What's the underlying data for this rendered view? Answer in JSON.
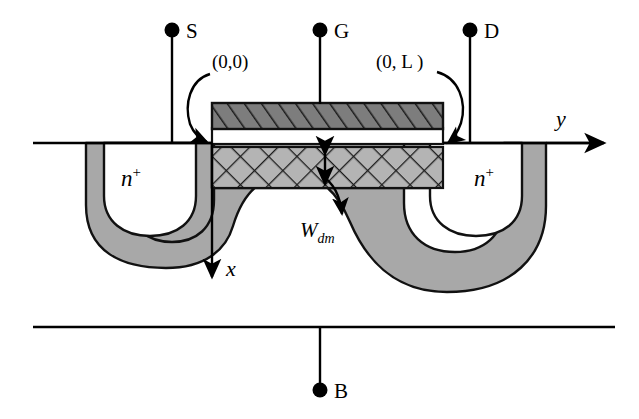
{
  "figure": {
    "background_color": "#ffffff",
    "line_color": "#000000",
    "depletion_fill": "#a8a8a8",
    "gate_fill": "#7a7a7a",
    "channel_fill": "#b0b0b0",
    "neutral_fill": "#ffffff"
  },
  "terminals": [
    {
      "id": "source",
      "label": "S",
      "dot_x": 172,
      "dot_y": 30
    },
    {
      "id": "gate",
      "label": "G",
      "dot_x": 320,
      "dot_y": 30
    },
    {
      "id": "drain",
      "label": "D",
      "dot_x": 470,
      "dot_y": 30
    },
    {
      "id": "body",
      "label": "B",
      "dot_x": 320,
      "dot_y": 390
    }
  ],
  "coordinate_callouts": [
    {
      "id": "origin",
      "label": "(0,0)",
      "text_x": 212,
      "text_y": 68
    },
    {
      "id": "channel-end",
      "label": "(0, L )",
      "label_plain": "(0, L)",
      "text_x": 378,
      "text_y": 68
    }
  ],
  "axes": [
    {
      "id": "y-axis",
      "label": "y",
      "direction": "right",
      "label_x": 558,
      "label_y": 126
    },
    {
      "id": "x-axis",
      "label": "x",
      "direction": "down",
      "label_x": 228,
      "label_y": 274
    }
  ],
  "region_labels": [
    {
      "id": "source-region",
      "base": "n",
      "superscript": "+",
      "x": 133,
      "y": 180
    },
    {
      "id": "drain-region",
      "base": "n",
      "superscript": "+",
      "x": 486,
      "y": 180
    }
  ],
  "annotations": [
    {
      "id": "depletion-width",
      "base": "W",
      "subscript": "dm",
      "text_x": 300,
      "text_y": 237,
      "description": "maximum depletion width under the gate"
    }
  ],
  "geometry": {
    "surface_y": 143,
    "surface_x_start": 33,
    "surface_x_end": 608,
    "substrate_bottom_y": 327,
    "substrate_bottom_x_start": 33,
    "substrate_bottom_x_end": 615,
    "gate": {
      "x": 212,
      "y": 103,
      "width": 231,
      "height": 25
    },
    "oxide": {
      "x": 212,
      "y": 128,
      "width": 231,
      "height": 15
    },
    "channel_box": {
      "x": 212,
      "y": 147,
      "width": 231,
      "height": 41
    }
  }
}
